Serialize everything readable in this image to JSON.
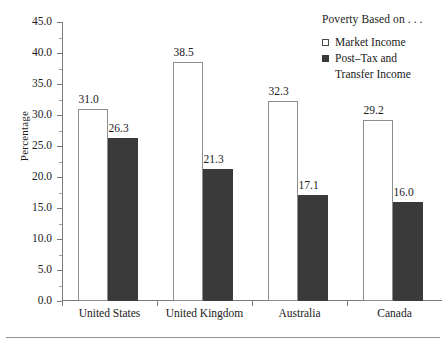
{
  "chart_data": {
    "type": "bar",
    "title": "",
    "xlabel": "",
    "ylabel": "Percentage",
    "categories": [
      "United States",
      "United Kingdom",
      "Australia",
      "Canada"
    ],
    "series": [
      {
        "name": "Market Income",
        "values": [
          31.0,
          38.5,
          32.3,
          29.2
        ],
        "style": "hollow",
        "color": "#ffffff",
        "edge_color": "#8b8e90"
      },
      {
        "name": "Post–Tax and Transfer Income",
        "values": [
          26.3,
          21.3,
          17.1,
          16.0
        ],
        "style": "filled",
        "color": "#3a3a3a",
        "edge_color": "#3a3a3a"
      }
    ],
    "value_labels": [
      [
        "31.0",
        "26.3"
      ],
      [
        "38.5",
        "21.3"
      ],
      [
        "32.3",
        "17.1"
      ],
      [
        "29.2",
        "16.0"
      ]
    ],
    "ylim": [
      0.0,
      45.0
    ],
    "ytick_values": [
      0.0,
      5.0,
      10.0,
      15.0,
      20.0,
      25.0,
      30.0,
      35.0,
      40.0,
      45.0
    ],
    "ytick_labels": [
      "0.0",
      "5.0",
      "10.0",
      "15.0",
      "20.0",
      "25.0",
      "30.0",
      "35.0",
      "40.0",
      "45.0"
    ],
    "yminor_values": [
      2.5,
      7.5,
      12.5,
      17.5,
      22.5,
      27.5,
      32.5,
      37.5,
      42.5
    ],
    "grid": false,
    "legend_position": "top-right"
  },
  "legend": {
    "title": "Poverty Based on . . .",
    "entries": [
      {
        "label": "Market Income",
        "label_line2": "",
        "swatch": "hollow-square-icon"
      },
      {
        "label": "Post–Tax and",
        "label_line2": "Transfer Income",
        "swatch": "filled-square-icon"
      }
    ]
  },
  "axes": {
    "y_title": "Percentage"
  }
}
